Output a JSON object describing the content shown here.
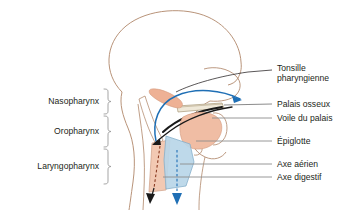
{
  "figure": {
    "colors": {
      "outline": "#b0876a",
      "mucosa_salmon": "#f0bda4",
      "airway_blue": "#b9d6e8",
      "arrow_blue": "#1f6fb5",
      "arrow_black": "#1a1a1a",
      "leader_gray": "#8c8c8c",
      "bracket_gray": "#9b9b9b",
      "text": "#231f20"
    }
  },
  "left_labels": [
    {
      "id": "nasopharynx",
      "text": "Nasopharynx"
    },
    {
      "id": "oropharynx",
      "text": "Oropharynx"
    },
    {
      "id": "laryngopharynx",
      "text": "Laryngopharynx"
    }
  ],
  "right_labels": [
    {
      "id": "tonsille-pharyngienne",
      "line1": "Tonsille",
      "line2": "pharyngienne"
    },
    {
      "id": "palais-osseux",
      "line1": "Palais osseux",
      "line2": ""
    },
    {
      "id": "voile-du-palais",
      "line1": "Voile du palais",
      "line2": ""
    },
    {
      "id": "epiglotte",
      "line1": "Épiglotte",
      "line2": ""
    },
    {
      "id": "axe-aerien",
      "line1": "Axe aérien",
      "line2": ""
    },
    {
      "id": "axe-digestif",
      "line1": "Axe digestif",
      "line2": ""
    }
  ]
}
